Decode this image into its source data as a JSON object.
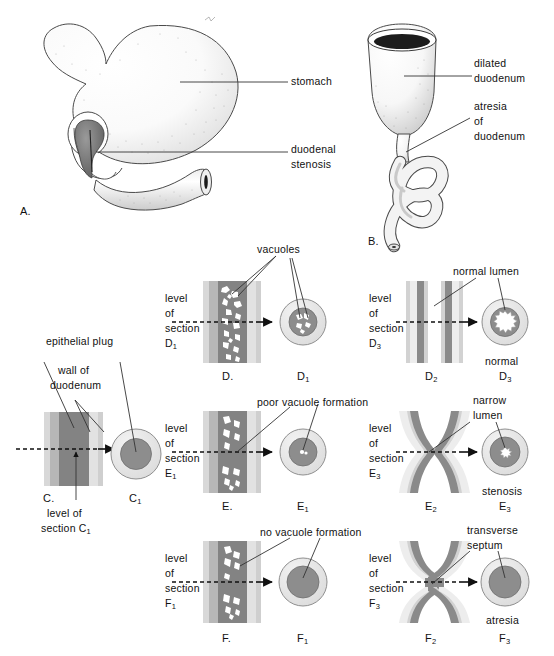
{
  "figure": {
    "background": "#ffffff",
    "ink": "#111111"
  },
  "colors": {
    "wall_light": "#d8d8d8",
    "wall_mid": "#b4b4b4",
    "core_dark": "#8d8d8d",
    "core_darker": "#7d7d7d",
    "ring_pale": "#e4e4e4",
    "vacuole_white": "#ffffff",
    "outline": "#555555",
    "leader": "#333333"
  },
  "panels": {
    "A": {
      "id": "A.",
      "labels": [
        {
          "key": "stomach",
          "text": "stomach"
        },
        {
          "key": "duodenal_stenosis_line1",
          "text": "duodenal"
        },
        {
          "key": "duodenal_stenosis_line2",
          "text": "stenosis"
        }
      ]
    },
    "B": {
      "id": "B.",
      "labels": [
        {
          "key": "dilated_line1",
          "text": "dilated"
        },
        {
          "key": "dilated_line2",
          "text": "duodenum"
        },
        {
          "key": "atresia_line1",
          "text": "atresia"
        },
        {
          "key": "atresia_line2",
          "text": "of"
        },
        {
          "key": "atresia_line3",
          "text": "duodenum"
        }
      ]
    },
    "C": {
      "id": "C.",
      "section_id": "C",
      "section_sub": "1",
      "labels": [
        {
          "key": "epithelial_plug",
          "text": "epithelial plug"
        },
        {
          "key": "wall_line1",
          "text": "wall of"
        },
        {
          "key": "wall_line2",
          "text": "duodenum"
        },
        {
          "key": "level_line1",
          "text": "level of"
        },
        {
          "key": "level_line2",
          "text": "section C"
        },
        {
          "key": "level_sub",
          "text": "1"
        }
      ]
    },
    "D": {
      "id": "D.",
      "sec_id": "D",
      "sec_sub": "1",
      "mid_id": "D",
      "mid_sub": "2",
      "right_id": "D",
      "right_sub": "3",
      "level1": {
        "l1": "level",
        "l2": "of",
        "l3": "section",
        "l4": "D",
        "sub": "1"
      },
      "level3": {
        "l1": "level",
        "l2": "of",
        "l3": "section",
        "l4": "D",
        "sub": "3"
      },
      "callouts": [
        {
          "key": "vacuoles",
          "text": "vacuoles"
        },
        {
          "key": "normal_lumen",
          "text": "normal lumen"
        }
      ],
      "status": "normal"
    },
    "E": {
      "id": "E.",
      "sec_id": "E",
      "sec_sub": "1",
      "mid_id": "E",
      "mid_sub": "2",
      "right_id": "E",
      "right_sub": "3",
      "level1": {
        "l1": "level",
        "l2": "of",
        "l3": "section",
        "l4": "E",
        "sub": "1"
      },
      "level3": {
        "l1": "level",
        "l2": "of",
        "l3": "section",
        "l4": "E",
        "sub": "3"
      },
      "callouts": [
        {
          "key": "poor_vacuole",
          "text": "poor vacuole formation"
        },
        {
          "key": "narrow_lumen_l1",
          "text": "narrow"
        },
        {
          "key": "narrow_lumen_l2",
          "text": "lumen"
        }
      ],
      "status": "stenosis"
    },
    "F": {
      "id": "F.",
      "sec_id": "F",
      "sec_sub": "1",
      "mid_id": "F",
      "mid_sub": "2",
      "right_id": "F",
      "right_sub": "3",
      "level1": {
        "l1": "level",
        "l2": "of",
        "l3": "section",
        "l4": "F",
        "sub": "1"
      },
      "level3": {
        "l1": "level",
        "l2": "of",
        "l3": "section",
        "l4": "F",
        "sub": "3"
      },
      "callouts": [
        {
          "key": "no_vacuole",
          "text": "no vacuole formation"
        },
        {
          "key": "transverse_l1",
          "text": "transverse"
        },
        {
          "key": "transverse_l2",
          "text": "septum"
        }
      ],
      "status": "atresia"
    }
  }
}
